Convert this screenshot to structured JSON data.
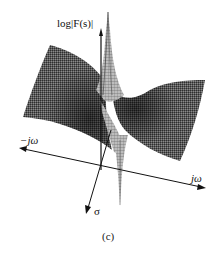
{
  "figure": {
    "caption": "(c)",
    "vertical_axis_label": "log|F(s)|",
    "horizontal_axis_neg_label": "−jω",
    "horizontal_axis_pos_label": "jω",
    "depth_axis_label": "σ",
    "colors": {
      "surface_dark": "#3a3a3a",
      "surface_mid": "#6e6e6e",
      "surface_light": "#9a9a9a",
      "axis": "#111111",
      "background": "#ffffff"
    }
  }
}
